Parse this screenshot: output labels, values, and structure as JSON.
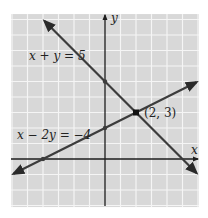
{
  "chart_data": {
    "type": "line",
    "title": "",
    "xlabel": "x",
    "ylabel": "y",
    "xlim": [
      -6,
      6
    ],
    "ylim": [
      -3.1,
      9.35
    ],
    "grid": true,
    "legend": "none",
    "series": [
      {
        "name": "x + y = 5",
        "equation": "x + y = 5",
        "x": [
          -3.9,
          5.9
        ],
        "y": [
          8.9,
          -0.9
        ],
        "points": [
          [
            0,
            5
          ],
          [
            2,
            3
          ]
        ],
        "arrows": "both"
      },
      {
        "name": "x − 2y = −4",
        "equation": "x − 2y = −4",
        "x": [
          -5.9,
          5.9
        ],
        "y": [
          -0.95,
          4.95
        ],
        "points": [
          [
            -4,
            0
          ],
          [
            0,
            2
          ],
          [
            2,
            3
          ]
        ],
        "arrows": "both"
      }
    ],
    "annotations": [
      {
        "text": "(2, 3)",
        "x": 2,
        "y": 3,
        "note": "intersection point"
      }
    ]
  },
  "labels": {
    "x_axis": "x",
    "y_axis": "y",
    "line1": "x + y = 5",
    "line2": "x − 2y = −4",
    "intersection": "(2, 3)"
  },
  "colors": {
    "grid_fill": "#d8d8d8",
    "grid_line": "#f5f5f5",
    "axis": "#1e1e1e",
    "plot_line": "#3c3c3c",
    "point": "#111111"
  }
}
